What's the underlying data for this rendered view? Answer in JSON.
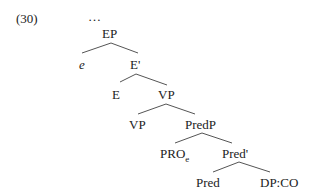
{
  "example_number": "(30)",
  "ellipsis": "…",
  "tree": {
    "nodes": {
      "EP": "EP",
      "e": "e",
      "E_bar": "E'",
      "E": "E",
      "VP_top": "VP",
      "VP_low": "VP",
      "PredP": "PredP",
      "PRO": "PRO",
      "PRO_sub": "e",
      "Pred_bar": "Pred'",
      "Pred": "Pred",
      "DP_CO": "DP:CO"
    },
    "edges": [
      [
        "EP",
        "e"
      ],
      [
        "EP",
        "E'"
      ],
      [
        "E'",
        "E"
      ],
      [
        "E'",
        "VP"
      ],
      [
        "VP",
        "VP"
      ],
      [
        "VP",
        "PredP"
      ],
      [
        "PredP",
        "PRO_e"
      ],
      [
        "PredP",
        "Pred'"
      ],
      [
        "Pred'",
        "Pred"
      ],
      [
        "Pred'",
        "DP:CO"
      ]
    ]
  }
}
